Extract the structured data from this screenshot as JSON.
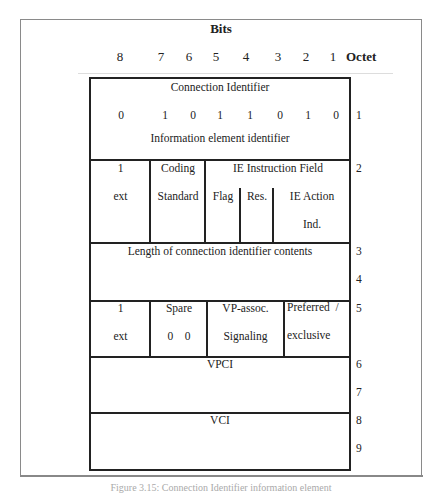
{
  "header": {
    "bits_title": "Bits",
    "bit_numbers": [
      "8",
      "7",
      "6",
      "5",
      "4",
      "3",
      "2",
      "1"
    ],
    "octet_label": "Octet"
  },
  "rows": {
    "octet1": {
      "title": "Connection Identifier",
      "bits": [
        "0",
        "1",
        "0",
        "1",
        "1",
        "0",
        "1",
        "0"
      ],
      "subtitle": "Information element identifier",
      "octet": "1"
    },
    "octet2": {
      "ext_bit": "1",
      "ext_label": "ext",
      "coding_line1": "Coding",
      "coding_line2": "Standard",
      "ie_instruction": "IE Instruction Field",
      "flag": "Flag",
      "res": "Res.",
      "ie_action_line1": "IE Action",
      "ie_action_line2": "Ind.",
      "octet": "2"
    },
    "octet3_4": {
      "label": "Length of connection identifier contents",
      "octets": [
        "3",
        "4"
      ]
    },
    "octet5": {
      "ext_bit": "1",
      "ext_label": "ext",
      "spare_label": "Spare",
      "spare_bits": "0    0",
      "vp_line1": "VP-assoc.",
      "vp_line2": "Signaling",
      "pref_line1": "Preferred  /",
      "pref_line2": "exclusive",
      "octet": "5"
    },
    "octet6_7": {
      "label": "VPCI",
      "octets": [
        "6",
        "7"
      ]
    },
    "octet8_9": {
      "label": "VCI",
      "octets": [
        "8",
        "9"
      ]
    }
  },
  "caption": "Figure 3.15: Connection Identifier information element"
}
